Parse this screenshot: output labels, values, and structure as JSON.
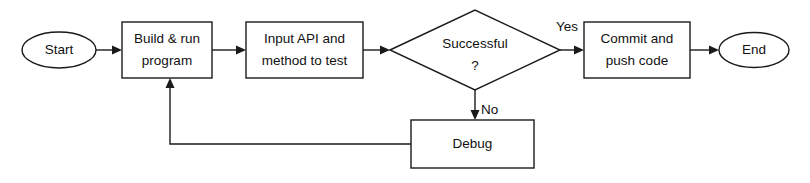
{
  "diagram": {
    "type": "flowchart",
    "orientation": "left-to-right",
    "background_color": "#ffffff",
    "line_color": "#1a1a1a",
    "text_color": "#111111",
    "nodes": {
      "start": {
        "label": "Start",
        "shape": "ellipse"
      },
      "build": {
        "label_line1": "Build & run",
        "label_line2": "program",
        "shape": "rectangle"
      },
      "input": {
        "label_line1": "Input API and",
        "label_line2": "method to test",
        "shape": "rectangle"
      },
      "decision": {
        "label_line1": "Successful",
        "label_line2": "?",
        "shape": "diamond"
      },
      "commit": {
        "label_line1": "Commit and",
        "label_line2": "push code",
        "shape": "rectangle"
      },
      "end": {
        "label": "End",
        "shape": "ellipse"
      },
      "debug": {
        "label": "Debug",
        "shape": "rectangle"
      }
    },
    "edge_labels": {
      "yes": "Yes",
      "no": "No"
    }
  }
}
